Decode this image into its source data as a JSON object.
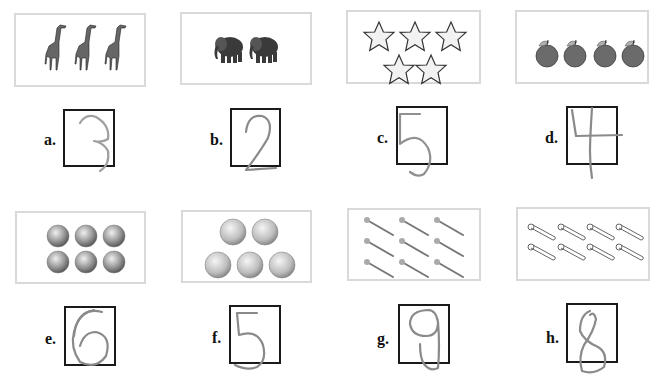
{
  "worksheet": {
    "items": [
      {
        "label": "a.",
        "object": "giraffe",
        "count": 3,
        "written_answer": "3"
      },
      {
        "label": "b.",
        "object": "elephant",
        "count": 2,
        "written_answer": "2"
      },
      {
        "label": "c.",
        "object": "star",
        "count": 5,
        "written_answer": "5"
      },
      {
        "label": "d.",
        "object": "apple",
        "count": 4,
        "written_answer": "4"
      },
      {
        "label": "e.",
        "object": "marble",
        "count": 6,
        "written_answer": "6"
      },
      {
        "label": "f.",
        "object": "baseball",
        "count": 5,
        "written_answer": "5"
      },
      {
        "label": "g.",
        "object": "nail",
        "count": 9,
        "written_answer": "9"
      },
      {
        "label": "h.",
        "object": "safety-pin",
        "count": 8,
        "written_answer": "8"
      }
    ]
  },
  "colors": {
    "picture_border": "#d9d9d9",
    "answer_border": "#1a1a1a",
    "pencil": "#8a8a8a"
  }
}
